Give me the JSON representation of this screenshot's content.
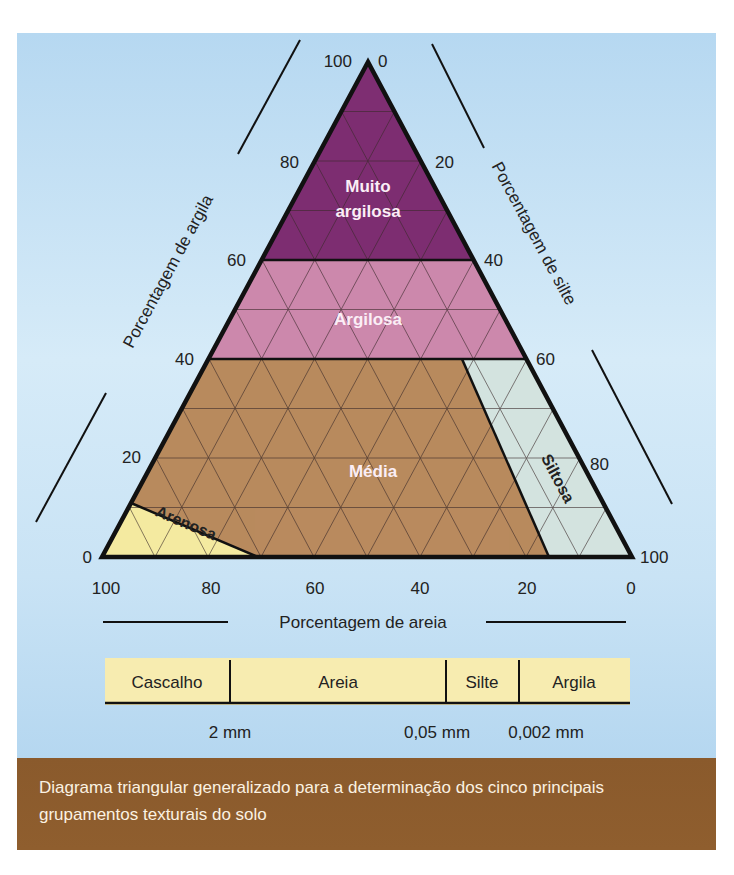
{
  "diagram": {
    "axes": {
      "clay": {
        "title": "Porcentagem de argila",
        "ticks": [
          "0",
          "20",
          "40",
          "60",
          "80",
          "100"
        ]
      },
      "silt": {
        "title": "Porcentagem de silte",
        "ticks": [
          "0",
          "20",
          "40",
          "60",
          "80",
          "100"
        ]
      },
      "sand": {
        "title": "Porcentagem de areia",
        "ticks": [
          "100",
          "80",
          "60",
          "40",
          "20",
          "0"
        ]
      }
    },
    "regions": [
      {
        "id": "muito-argilosa",
        "label_line1": "Muito",
        "label_line2": "argilosa",
        "color": "#7e2e72",
        "rule": "argila > 60%"
      },
      {
        "id": "argilosa",
        "label": "Argilosa",
        "color": "#cc88ad",
        "rule": "argila 35–60%"
      },
      {
        "id": "media",
        "label": "Média",
        "color": "#b98a5e",
        "rule": "argila < 35%, demais"
      },
      {
        "id": "siltosa",
        "label": "Siltosa",
        "color": "#d3e3df",
        "rule": "argila < 35%, areia < 15%"
      },
      {
        "id": "arenosa",
        "label": "Arenosa",
        "color": "#f4eaa0",
        "rule": "areia − argila > 70%"
      }
    ],
    "colors": {
      "outline": "#111111",
      "grid": "#3a2a2a",
      "background_top": "#b6d8f1",
      "background_mid": "#d6ebf8"
    }
  },
  "size_scale": {
    "cells": [
      "Cascalho",
      "Areia",
      "Silte",
      "Argila"
    ],
    "boundaries": [
      "2 mm",
      "0,05 mm",
      "0,002 mm"
    ],
    "fill": "#f7ecb0"
  },
  "caption": {
    "text": "Diagrama triangular generalizado para a determinação dos cinco principais grupamentos texturais do solo",
    "background": "#8b5a2b"
  }
}
